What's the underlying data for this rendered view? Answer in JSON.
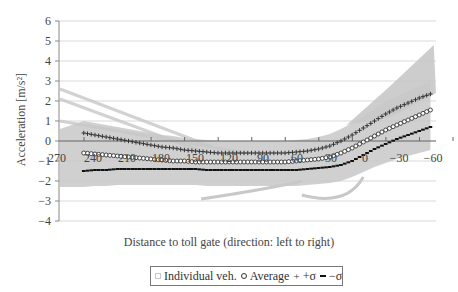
{
  "chart_data": {
    "type": "scatter",
    "title": "",
    "xlabel": "Distance to toll gate (direction: left to right)",
    "ylabel": "Acceleration [m/s2]",
    "ylabel_display": "Acceleration [m/s²]",
    "x_ticks": [
      "270",
      "240",
      "210",
      "180",
      "150",
      "120",
      "90",
      "60",
      "30",
      "0",
      "−30",
      "−60"
    ],
    "x_tick_values": [
      270,
      240,
      210,
      180,
      150,
      120,
      90,
      60,
      30,
      0,
      -30,
      -60
    ],
    "y_ticks": [
      "6",
      "5",
      "4",
      "3",
      "2",
      "1",
      "0",
      "−1",
      "−2",
      "−3",
      "−4"
    ],
    "y_tick_values": [
      6,
      5,
      4,
      3,
      2,
      1,
      0,
      -1,
      -2,
      -3,
      -4
    ],
    "ylim": [
      -4,
      6
    ],
    "xlim": [
      270,
      -60
    ],
    "x_reversed": true,
    "grid": "horizontal",
    "legend_position": "bottom",
    "legend": [
      "Individual veh.",
      "Average",
      "+σ",
      "−σ"
    ],
    "x": [
      255,
      245,
      235,
      225,
      215,
      205,
      195,
      185,
      175,
      165,
      155,
      145,
      135,
      125,
      115,
      105,
      95,
      85,
      75,
      65,
      55,
      45,
      35,
      25,
      15,
      5,
      -5,
      -15,
      -25,
      -35,
      -45,
      -55
    ],
    "series": [
      {
        "name": "Average",
        "marker": "open-circle",
        "values": [
          -0.6,
          -0.65,
          -0.7,
          -0.75,
          -0.8,
          -0.85,
          -0.9,
          -0.95,
          -1.0,
          -1.0,
          -1.05,
          -1.05,
          -1.05,
          -1.05,
          -1.05,
          -1.05,
          -1.05,
          -1.05,
          -1.05,
          -1.0,
          -0.95,
          -0.9,
          -0.8,
          -0.6,
          -0.35,
          -0.05,
          0.25,
          0.55,
          0.8,
          1.05,
          1.3,
          1.55
        ]
      },
      {
        "name": "+σ",
        "marker": "plus",
        "values": [
          0.4,
          0.3,
          0.2,
          0.1,
          0.0,
          -0.1,
          -0.2,
          -0.3,
          -0.35,
          -0.45,
          -0.5,
          -0.55,
          -0.6,
          -0.6,
          -0.6,
          -0.6,
          -0.6,
          -0.6,
          -0.6,
          -0.55,
          -0.5,
          -0.4,
          -0.25,
          0.0,
          0.3,
          0.65,
          1.0,
          1.35,
          1.65,
          1.9,
          2.15,
          2.35
        ]
      },
      {
        "name": "−σ",
        "marker": "dash",
        "values": [
          -1.5,
          -1.45,
          -1.45,
          -1.4,
          -1.4,
          -1.4,
          -1.4,
          -1.4,
          -1.4,
          -1.4,
          -1.4,
          -1.45,
          -1.45,
          -1.45,
          -1.45,
          -1.45,
          -1.45,
          -1.45,
          -1.45,
          -1.45,
          -1.4,
          -1.35,
          -1.3,
          -1.2,
          -1.0,
          -0.7,
          -0.4,
          -0.15,
          0.1,
          0.3,
          0.5,
          0.7
        ]
      },
      {
        "name": "Individual veh.",
        "marker": "open-square",
        "color": "#c8c8c8",
        "note": "dense grey band, roughly −2.3 to +1 over 270..30, fanning up to ~+4.8 near −60; a few traces start at +2.6/+1 at 270 descending"
      }
    ]
  },
  "colors": {
    "individual": "#c8c8c8",
    "average_stroke": "#333333",
    "plus": "#333333",
    "minus": "#111111",
    "grid": "#d9d9d9",
    "axis": "#888888",
    "text": "#444444"
  },
  "legend": {
    "individual_label": "Individual veh.",
    "average_label": "Average",
    "plus_symbol": "+",
    "plus_label": "+σ",
    "minus_label": "−σ"
  }
}
